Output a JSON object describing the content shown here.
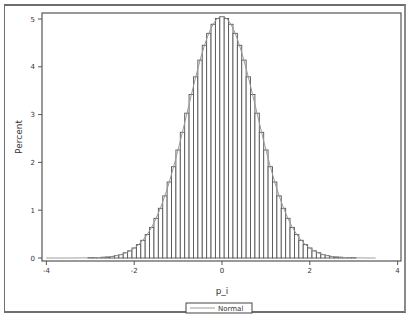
{
  "chart_data": {
    "type": "bar",
    "title": "",
    "xlabel": "p_i",
    "ylabel": "Percent",
    "xlim": [
      -4,
      4
    ],
    "ylim": [
      0,
      5.1
    ],
    "xticks": [
      "-4",
      "-2",
      "0",
      "2",
      "4"
    ],
    "yticks": [
      "0",
      "1",
      "2",
      "3",
      "4",
      "5"
    ],
    "grid": false,
    "legend": {
      "position": "bottom",
      "entries": [
        "Normal"
      ]
    },
    "bin_width": 0.1,
    "bin_centers": [
      -3.0,
      -2.9,
      -2.8,
      -2.7,
      -2.6,
      -2.5,
      -2.4,
      -2.3,
      -2.2,
      -2.1,
      -2.0,
      -1.9,
      -1.8,
      -1.7,
      -1.6,
      -1.5,
      -1.4,
      -1.3,
      -1.2,
      -1.1,
      -1.0,
      -0.9,
      -0.8,
      -0.7,
      -0.6,
      -0.5,
      -0.4,
      -0.3,
      -0.2,
      -0.1,
      0.0,
      0.1,
      0.2,
      0.3,
      0.4,
      0.5,
      0.6,
      0.7,
      0.8,
      0.9,
      1.0,
      1.1,
      1.2,
      1.3,
      1.4,
      1.5,
      1.6,
      1.7,
      1.8,
      1.9,
      2.0,
      2.1,
      2.2,
      2.3,
      2.4,
      2.5,
      2.6,
      2.7,
      2.8,
      2.9,
      3.0
    ],
    "values": [
      0.004,
      0.006,
      0.01,
      0.015,
      0.02,
      0.03,
      0.05,
      0.07,
      0.11,
      0.15,
      0.21,
      0.28,
      0.37,
      0.49,
      0.64,
      0.83,
      1.04,
      1.3,
      1.59,
      1.91,
      2.26,
      2.63,
      3.03,
      3.42,
      3.79,
      4.14,
      4.45,
      4.7,
      4.89,
      5.01,
      5.05,
      5.01,
      4.89,
      4.7,
      4.45,
      4.14,
      3.79,
      3.42,
      3.03,
      2.63,
      2.26,
      1.91,
      1.59,
      1.3,
      1.04,
      0.83,
      0.64,
      0.49,
      0.37,
      0.28,
      0.21,
      0.15,
      0.11,
      0.07,
      0.05,
      0.03,
      0.02,
      0.015,
      0.01,
      0.006,
      0.004
    ],
    "normal_curve": {
      "name": "Normal",
      "mean": 0.0,
      "peak_percent": 5.05,
      "sd": 0.79,
      "x_range": [
        -4.0,
        3.5
      ]
    }
  },
  "axes": {
    "x_label": "p_i",
    "y_label": "Percent"
  },
  "legend": {
    "label": "Normal"
  },
  "colors": {
    "bar_fill": "#ffffff",
    "bar_edge": "#555555",
    "curve": "#9a9a9a",
    "axis": "#555555",
    "frame": "#6e6e6e"
  }
}
